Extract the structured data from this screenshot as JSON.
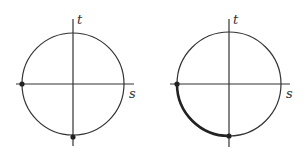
{
  "figures": [
    {
      "id": "left",
      "center": [
        73,
        84
      ],
      "radius": 51,
      "axis_labels": {
        "horizontal": "s",
        "vertical": "t"
      },
      "points": [
        {
          "name": "left-point",
          "pos": [
            22,
            84
          ]
        },
        {
          "name": "bottom-point",
          "pos": [
            73,
            137
          ]
        }
      ],
      "highlighted_arc": false
    },
    {
      "id": "right",
      "center": [
        229,
        84
      ],
      "radius": 52,
      "axis_labels": {
        "horizontal": "s",
        "vertical": "t"
      },
      "points": [
        {
          "name": "left-point",
          "pos": [
            177,
            84
          ]
        },
        {
          "name": "bottom-point",
          "pos": [
            229,
            137
          ]
        }
      ],
      "highlighted_arc": true
    }
  ],
  "colors": {
    "stroke": "#333333",
    "background": "#ffffff"
  }
}
